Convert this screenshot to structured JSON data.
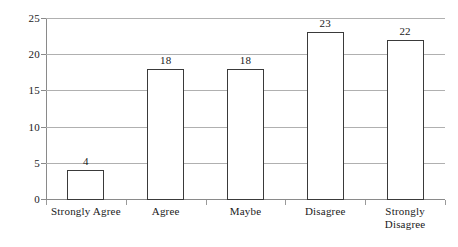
{
  "chart_data": {
    "type": "bar",
    "title": "",
    "subtitle": "",
    "xlabel": "",
    "ylabel": "",
    "categories": [
      "Strongly Agree",
      "Agree",
      "Maybe",
      "Disagree",
      "Strongly\nDisagree"
    ],
    "values": [
      4,
      18,
      18,
      23,
      22
    ],
    "data_labels": [
      "4",
      "18",
      "18",
      "23",
      "22"
    ],
    "ylim": [
      0,
      25
    ],
    "y_ticks": [
      0,
      5,
      10,
      15,
      20,
      25
    ],
    "y_tick_labels": [
      "0",
      "5",
      "10",
      "15",
      "20",
      "25"
    ],
    "grid": "horizontal",
    "legend": "none",
    "bar_fill": "#ffffff",
    "bar_stroke": "#3a3a3a",
    "gridline_color": "#b0b0b0",
    "axis_color": "#8a8a8a"
  }
}
